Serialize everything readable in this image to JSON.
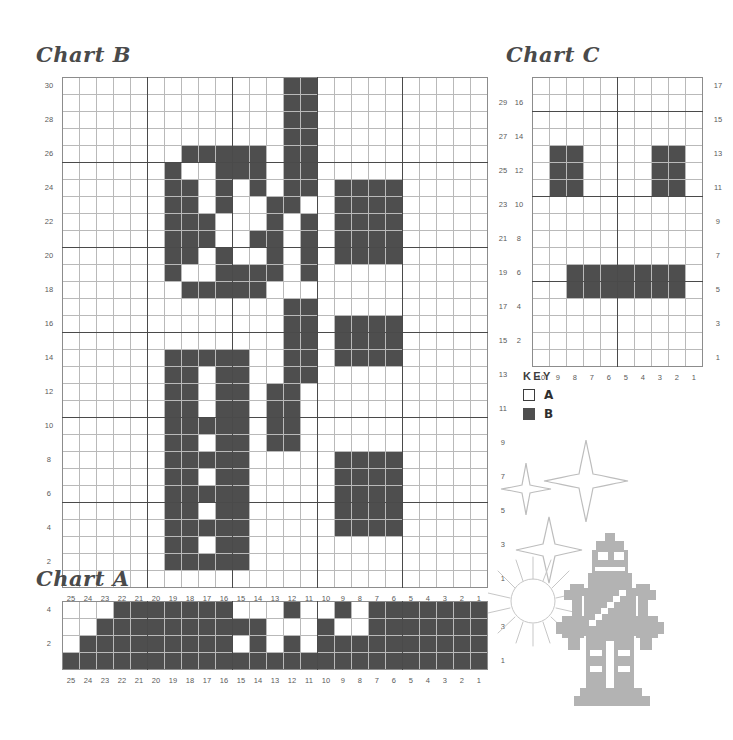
{
  "page": {
    "background": "#ffffff",
    "ink": "#4e4e4e",
    "grid_line": "#b9b9b9",
    "heavy_line": "#4a4a4a",
    "art_color": "#b3b3b3"
  },
  "charts": {
    "b": {
      "title": "Chart B",
      "cols": 25,
      "rows": 30,
      "col_labels": [
        25,
        24,
        23,
        22,
        21,
        20,
        19,
        18,
        17,
        16,
        15,
        14,
        13,
        12,
        11,
        10,
        9,
        8,
        7,
        6,
        5,
        4,
        3,
        2,
        1
      ],
      "row_labels_left": [
        30,
        28,
        26,
        24,
        22,
        20,
        18,
        16,
        14,
        12,
        10,
        8,
        6,
        4,
        2
      ],
      "row_labels_right": [
        29,
        27,
        25,
        23,
        21,
        19,
        17,
        15,
        13,
        11,
        9,
        7,
        5,
        3,
        1
      ]
    },
    "c": {
      "title": "Chart C",
      "cols": 10,
      "rows": 17,
      "col_labels": [
        10,
        9,
        8,
        7,
        6,
        5,
        4,
        3,
        2,
        1
      ],
      "row_labels_left": [
        16,
        14,
        12,
        10,
        8,
        6,
        4,
        2
      ],
      "row_labels_right": [
        17,
        15,
        13,
        11,
        9,
        7,
        5,
        3,
        1
      ]
    },
    "a": {
      "title": "Chart A",
      "cols": 25,
      "rows": 4,
      "col_labels": [
        25,
        24,
        23,
        22,
        21,
        20,
        19,
        18,
        17,
        16,
        15,
        14,
        13,
        12,
        11,
        10,
        9,
        8,
        7,
        6,
        5,
        4,
        3,
        2,
        1
      ],
      "row_labels_left": [
        4,
        2
      ],
      "row_labels_right": [
        3,
        1
      ]
    }
  },
  "key": {
    "title": "KEY",
    "entries": [
      {
        "label": "A",
        "swatch": "white"
      },
      {
        "label": "B",
        "swatch": "dark"
      }
    ]
  },
  "chart_data": [
    {
      "name": "Chart B",
      "type": "heatmap",
      "title": "Chart B",
      "xlabel": "",
      "ylabel": "",
      "legend": [
        "A",
        "B"
      ],
      "grid": true,
      "cols": 25,
      "rows": 30,
      "x_tick_labels": [
        25,
        24,
        23,
        22,
        21,
        20,
        19,
        18,
        17,
        16,
        15,
        14,
        13,
        12,
        11,
        10,
        9,
        8,
        7,
        6,
        5,
        4,
        3,
        2,
        1
      ],
      "y_tick_labels_left": [
        30,
        28,
        26,
        24,
        22,
        20,
        18,
        16,
        14,
        12,
        10,
        8,
        6,
        4,
        2
      ],
      "y_tick_labels_right": [
        29,
        27,
        25,
        23,
        21,
        19,
        17,
        15,
        13,
        11,
        9,
        7,
        5,
        3,
        1
      ],
      "values_note": "Row 30 at top down to row 1 at bottom; each string has 25 chars, leftmost char = column 25. '.'=A (white), '#'=B (dark).",
      "values": [
        ".............##..........",
        ".............##..........",
        ".............##..........",
        ".............##..........",
        ".......#####.##..........",
        "......#..###.##..........",
        "......##.#.#.##.####.....",
        "......##.#..##..####.....",
        "......###...#.#.####.....",
        "......###..##.#.####.....",
        "......##.#..#.#.####.....",
        "......#..####.#..........",
        ".......#####.............",
        ".............##..........",
        ".............##.####.....",
        ".............##.####.....",
        "......#####..##.####.....",
        "......##.##..##..........",
        "......##.##.##...........",
        "......##.##.##...........",
        "......#####.##...........",
        "......##.##.##...........",
        "......#####.....####.....",
        "......##.##.....####.....",
        "......#####.....####.....",
        "......##.##.....####.....",
        "......#####.....####.....",
        "......##.##..............",
        "......#####..............",
        "........................."
      ]
    },
    {
      "name": "Chart C",
      "type": "heatmap",
      "title": "Chart C",
      "xlabel": "",
      "ylabel": "",
      "legend": [
        "A",
        "B"
      ],
      "grid": true,
      "cols": 10,
      "rows": 17,
      "x_tick_labels": [
        10,
        9,
        8,
        7,
        6,
        5,
        4,
        3,
        2,
        1
      ],
      "y_tick_labels_left": [
        16,
        14,
        12,
        10,
        8,
        6,
        4,
        2
      ],
      "y_tick_labels_right": [
        17,
        15,
        13,
        11,
        9,
        7,
        5,
        3,
        1
      ],
      "values_note": "Row 17 at top down to row 1 at bottom; each string has 10 chars, leftmost char = column 10. '.'=A (white), '#'=B (dark).",
      "values": [
        "..........",
        "..........",
        "..........",
        "..........",
        ".##....##.",
        ".##....##.",
        ".##....##.",
        "..........",
        "..........",
        "..........",
        "..........",
        "..#######.",
        "..#######.",
        "..........",
        "..........",
        "..........",
        ".........."
      ]
    },
    {
      "name": "Chart A",
      "type": "heatmap",
      "title": "Chart A",
      "xlabel": "",
      "ylabel": "",
      "legend": [
        "A",
        "B"
      ],
      "grid": true,
      "cols": 25,
      "rows": 4,
      "x_tick_labels": [
        25,
        24,
        23,
        22,
        21,
        20,
        19,
        18,
        17,
        16,
        15,
        14,
        13,
        12,
        11,
        10,
        9,
        8,
        7,
        6,
        5,
        4,
        3,
        2,
        1
      ],
      "y_tick_labels_left": [
        4,
        2
      ],
      "y_tick_labels_right": [
        3,
        1
      ],
      "values_note": "Row 4 at top down to row 1 at bottom; each string has 25 chars, leftmost char = column 25. '.'=A (white), '#'=B (dark).",
      "values": [
        "...######.#..#..########...",
        "..###########..#.###########..",
        ".########.#.#.#############.",
        "#########################"
      ],
      "values_fixed": [
        "...#######...#..#.########...",
        "..##########...#..##########.",
        ".#########.#.#.############.",
        "#########################"
      ]
    }
  ],
  "decor": {
    "robot": "pixel-robot",
    "stars": [
      "four-point-star-small",
      "four-point-star-large",
      "four-point-star-medium"
    ],
    "sunburst": "sunburst"
  }
}
